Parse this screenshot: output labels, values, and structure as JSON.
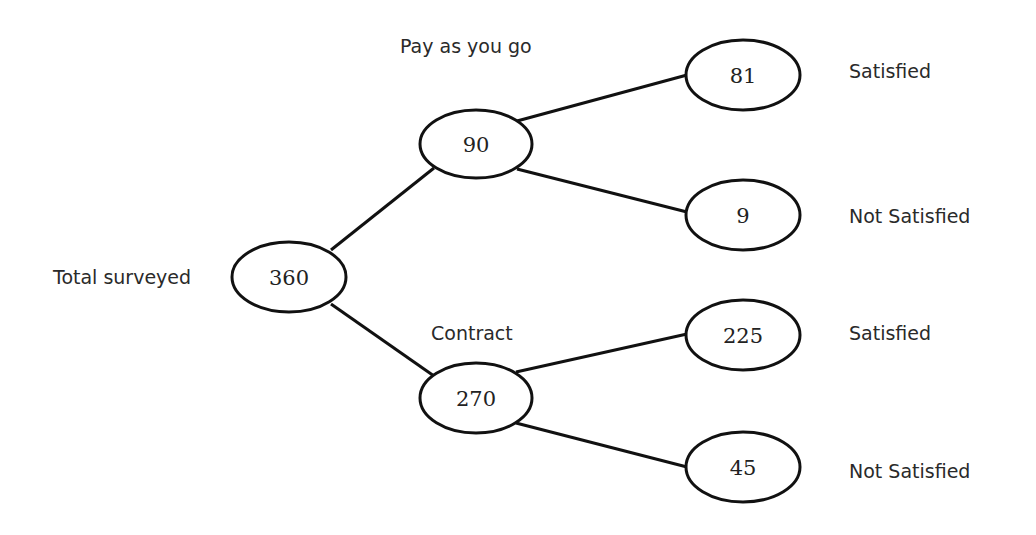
{
  "diagram": {
    "type": "tree",
    "root": {
      "label": "Total surveyed",
      "value": "360"
    },
    "branches": [
      {
        "label": "Pay as you go",
        "value": "90",
        "outcomes": [
          {
            "value": "81",
            "label": "Satisfied"
          },
          {
            "value": "9",
            "label": "Not Satisfied"
          }
        ]
      },
      {
        "label": "Contract",
        "value": "270",
        "outcomes": [
          {
            "value": "225",
            "label": "Satisfied"
          },
          {
            "value": "45",
            "label": "Not Satisfied"
          }
        ]
      }
    ]
  },
  "colors": {
    "stroke": "#111111",
    "text": "#222222",
    "background": "#ffffff"
  }
}
